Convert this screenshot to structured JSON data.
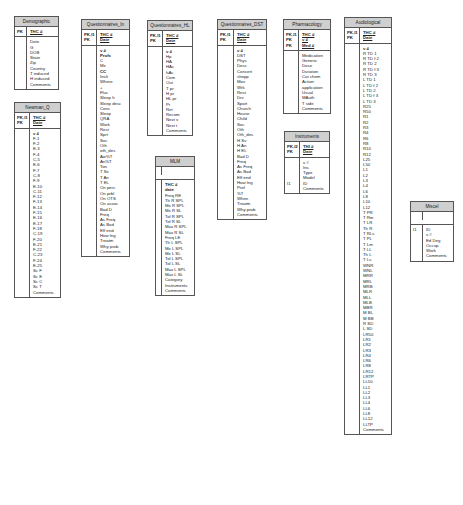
{
  "diagram": {
    "type": "database-schema",
    "tables": [
      {
        "id": "demographic",
        "title": "Demographic",
        "key_flags": [
          "PK"
        ],
        "keys": [
          "THC #"
        ],
        "body_flags": [],
        "fields": [
          "Date",
          "G",
          "DOB",
          "State",
          "Zip",
          "Country",
          "T induced",
          "H induced",
          "Comments"
        ]
      },
      {
        "id": "newman_q",
        "title": "Newman_Q",
        "key_flags": [
          "PK,I1",
          "PK"
        ],
        "keys": [
          "THC #",
          "Date"
        ],
        "body_flags": [],
        "fields": [
          "v #",
          "F-1",
          "F-2",
          "E-3",
          "F-4",
          "C-5",
          "E-6",
          "F-7",
          "C-8",
          "F-9",
          "E-10",
          "C-11",
          "F-12",
          "F-13",
          "E-14",
          "F-15",
          "E-16",
          "E-17",
          "F-18",
          "C-19",
          "F-20",
          "E-21",
          "F-22",
          "C-23",
          "F-24",
          "E-25",
          "Sc F",
          "Sc E",
          "Sc C",
          "Sc T",
          "Comments"
        ]
      },
      {
        "id": "questionnaires_in",
        "title": "Questionnaires_In",
        "key_flags": [
          "PK,I1",
          "PK"
        ],
        "keys": [
          "THC #",
          "Date"
        ],
        "body_flags": [],
        "fields": [
          "v #",
          "Profs",
          "C",
          "Mx",
          "CC",
          "Inslt",
          "Where",
          "+",
          "Fluc",
          "Sleep h",
          "Sleep desc",
          "Conc",
          "Sleep",
          "QRA",
          "Work",
          "Rest",
          "Sprt",
          "Soc",
          "Oth",
          "oth_des",
          "Aw%T",
          "An%T",
          "Ton",
          "T Sv",
          "T An",
          "T EL",
          "On perc",
          "On prbl",
          "On OTS",
          "On assoc",
          "Bad D",
          "Freq",
          "As Freq",
          "As Bad",
          "Eff end",
          "How lng",
          "Treatm",
          "Why prob",
          "Comments"
        ]
      },
      {
        "id": "questionnaires_hl",
        "title": "Questionnaires_HL",
        "key_flags": [
          "PK,I1",
          "PK"
        ],
        "keys": [
          "THC #",
          "Date"
        ],
        "body_flags": [],
        "fields": [
          "v #",
          "Hp",
          "HA",
          "HAc",
          "hAc",
          "Com",
          "Out",
          "T pr",
          "H pr",
          "HL pr",
          "Pr",
          "Ret",
          "Recom",
          "Next v",
          "Next t",
          "Comments"
        ]
      },
      {
        "id": "mlm",
        "title": "MLM",
        "key_flags": [],
        "keys": [],
        "body_flags": [],
        "fields": [
          "THC #",
          "date",
          "Freq RE",
          "Th R SPL",
          "Mx R SPL",
          "Mx R SL",
          "Tol R SPL",
          "Tol R SL",
          "Max R SPL",
          "Max R SL",
          "Freq LE",
          "Th L SPL",
          "Mx L SPL",
          "Mx L SL",
          "Tol L SPL",
          "Tol L SL",
          "Max L SPL",
          "Max L SL",
          "Category",
          "Instruments",
          "Comments"
        ]
      },
      {
        "id": "questionnaires_dst",
        "title": "Questionnaires_DST",
        "key_flags": [
          "PK,I1",
          "PK"
        ],
        "keys": [
          "THC #",
          "Date"
        ],
        "body_flags": [],
        "fields": [
          "v #",
          "DST",
          "Phys",
          "Desc",
          "Concert",
          "shopp",
          "Mov",
          "Wrk",
          "Rest",
          "Drv",
          "Sport",
          "Church",
          "House",
          "Child",
          "Soc",
          "Oth",
          "Oth_des",
          "H Sv",
          "H An",
          "H EL",
          "Bad D",
          "Freq",
          "As Freq",
          "As Bad",
          "Eff end",
          "How lng",
          "Prof",
          "%T",
          "When",
          "Treatm",
          "Why prob",
          "Comments"
        ]
      },
      {
        "id": "pharmacology",
        "title": "Pharmacology",
        "key_flags": [
          "PK,I1",
          "PK",
          "PK"
        ],
        "keys": [
          "THC #",
          "v #",
          "Med #"
        ],
        "body_flags": [],
        "fields": [
          "Medication",
          "Generic",
          "Dose",
          "Duration",
          "Cat chem",
          "Action",
          "application",
          "Usual",
          "MAuth",
          "T side",
          "Comments"
        ]
      },
      {
        "id": "instruments",
        "title": "Instruments",
        "key_flags": [
          "PK,I2",
          "PK"
        ],
        "keys": [
          "THI #",
          "Date"
        ],
        "body_flags": [
          "",
          "",
          "",
          "",
          "I1",
          ""
        ],
        "fields": [
          "v #",
          "Ins",
          "Type",
          "Model",
          "ID",
          "Comments"
        ]
      },
      {
        "id": "audiological",
        "title": "Audiological",
        "key_flags": [
          "PK,I1",
          "PK"
        ],
        "keys": [
          "THC #",
          "Date"
        ],
        "body_flags": [],
        "fields": [
          "v #",
          "R TD 1",
          "R TD f 2",
          "R TD 2",
          "R TD f 3",
          "R TD 3",
          "L TD 1",
          "L TD f 2",
          "L TD 2",
          "L TD f 3",
          "L TD 3",
          "R25",
          "R50",
          "R1",
          "R2",
          "R3",
          "R4",
          "R6",
          "R8",
          "R10",
          "R12",
          "L25",
          "L50",
          "L1",
          "L2",
          "L3",
          "L4",
          "L6",
          "L8",
          "L10",
          "L12",
          "T PR",
          "T Rm",
          "T LR",
          "Th R",
          "T RLs",
          "T PL",
          "T Lm",
          "T LL",
          "Th L",
          "T Ls",
          "WNR",
          "WNL",
          "MRR",
          "MRL",
          "MRB",
          "MLR",
          "MLL",
          "MLB",
          "MBR",
          "M BL",
          "M BB",
          "R SD",
          "L SD",
          "LR50",
          "LR1",
          "LR2",
          "LR3",
          "LR4",
          "LR6",
          "LR8",
          "LR12",
          "LRTP",
          "LL50",
          "LL1",
          "LL2",
          "LL3",
          "LL4",
          "LL6",
          "LL8",
          "LL12",
          "LLTP",
          "Comments"
        ]
      },
      {
        "id": "miscel",
        "title": "Miscel",
        "key_flags": [],
        "keys": [],
        "body_flags": [
          "I1"
        ],
        "fields": [
          "ID",
          "v #",
          "Ed Deg",
          "Occup",
          "Work",
          "Comments"
        ]
      }
    ]
  },
  "labels": {
    "demographic": {
      "title": "Demographic",
      "k0f": "PK",
      "k0": "THC #"
    },
    "newman_q": {
      "title": "Newman_Q",
      "k0f": "PK,I1",
      "k1f": "PK",
      "k0": "THC #",
      "k1": "Date"
    },
    "questionnaires_in": {
      "title": "Questionnaires_In",
      "k0f": "PK,I1",
      "k1f": "PK",
      "k0": "THC #",
      "k1": "Date"
    },
    "questionnaires_hl": {
      "title": "Questionnaires_HL",
      "k0f": "PK,I1",
      "k1f": "PK",
      "k0": "THC #",
      "k1": "Date"
    },
    "mlm": {
      "title": "MLM"
    },
    "questionnaires_dst": {
      "title": "Questionnaires_DST",
      "k0f": "PK,I1",
      "k1f": "PK",
      "k0": "THC #",
      "k1": "Date"
    },
    "pharmacology": {
      "title": "Pharmacology",
      "k0f": "PK,I1",
      "k1f": "PK",
      "k2f": "PK",
      "k0": "THC #",
      "k1": "v #",
      "k2": "Med #"
    },
    "instruments": {
      "title": "Instruments",
      "k0f": "PK,I2",
      "k1f": "PK",
      "k0": "THI #",
      "k1": "Date",
      "bf": "I1"
    },
    "audiological": {
      "title": "Audiological",
      "k0f": "PK,I1",
      "k1f": "PK",
      "k0": "THC #",
      "k1": "Date"
    },
    "miscel": {
      "title": "Miscel",
      "bf": "I1"
    }
  },
  "colors": {
    "header_bg": "#cfcfcf",
    "border": "#555555",
    "background": "#ffffff"
  }
}
